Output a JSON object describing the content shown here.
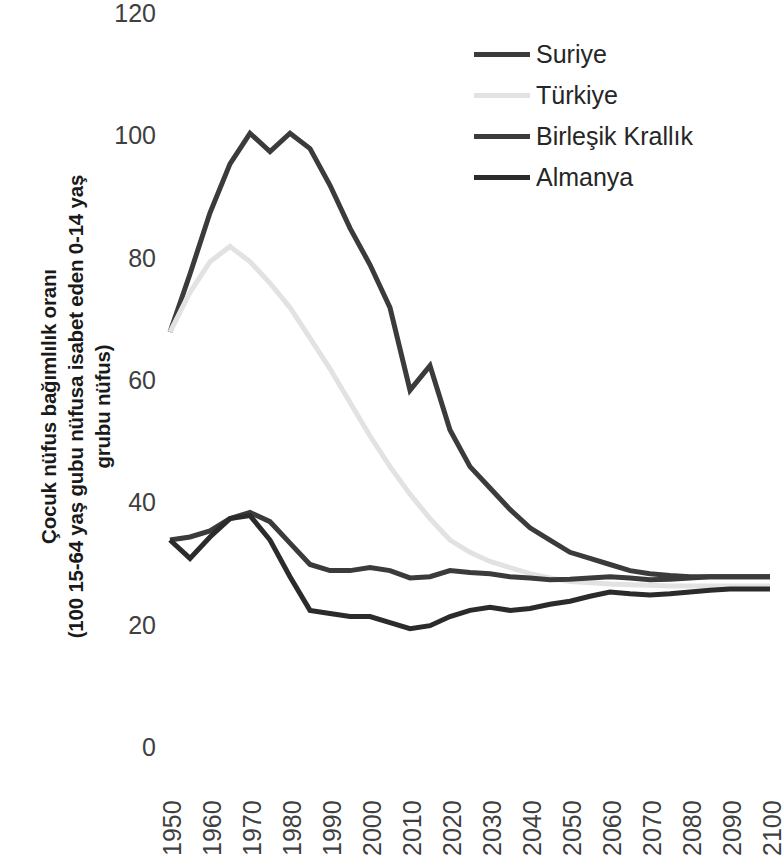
{
  "axis": {
    "y_title_lines": [
      "Çocuk nüfus bağımlılık oranı",
      "(100 15-64 yaş gubu nüfusa isabet eden 0-14 yaş",
      "grubu nüfus)"
    ],
    "y_ticks": [
      "0",
      "20",
      "40",
      "60",
      "80",
      "100",
      "120"
    ],
    "x_ticks": [
      "1950",
      "1960",
      "1970",
      "1980",
      "1990",
      "2000",
      "2010",
      "2020",
      "2030",
      "2040",
      "2050",
      "2060",
      "2070",
      "2080",
      "2090",
      "2100"
    ]
  },
  "legend": {
    "position": "top-right",
    "items": [
      {
        "label": "Suriye",
        "color": "#3b3b3b"
      },
      {
        "label": "Türkiye",
        "color": "#e2e2e2"
      },
      {
        "label": "Birleşik Krallık",
        "color": "#3b3b3b"
      },
      {
        "label": "Almanya",
        "color": "#2b2b2b"
      }
    ]
  },
  "chart_data": {
    "type": "line",
    "title": "",
    "xlabel": "",
    "ylabel": "Çocuk nüfus bağımlılık oranı (100 15-64 yaş gubu nüfusa isabet eden 0-14 yaş grubu nüfus)",
    "xlim": [
      1950,
      2100
    ],
    "ylim": [
      0,
      120
    ],
    "ytick_step": 20,
    "xtick_step": 10,
    "grid": false,
    "legend_position": "top-right",
    "x": [
      1950,
      1955,
      1960,
      1965,
      1970,
      1975,
      1980,
      1985,
      1990,
      1995,
      2000,
      2005,
      2010,
      2015,
      2020,
      2025,
      2030,
      2035,
      2040,
      2045,
      2050,
      2055,
      2060,
      2065,
      2070,
      2075,
      2080,
      2085,
      2090,
      2095,
      2100
    ],
    "series": [
      {
        "name": "Suriye",
        "color": "#3b3b3b",
        "values": [
          68.0,
          77.5,
          87.5,
          95.5,
          100.5,
          97.5,
          100.5,
          98.0,
          92.0,
          85.0,
          79.0,
          72.0,
          58.5,
          62.5,
          52.0,
          46.0,
          42.5,
          39.0,
          36.0,
          34.0,
          32.0,
          31.0,
          30.0,
          29.0,
          28.5,
          28.2,
          28.0,
          28.0,
          28.0,
          28.0,
          28.0
        ]
      },
      {
        "name": "Türkiye",
        "color": "#e2e2e2",
        "values": [
          68.0,
          74.5,
          79.5,
          82.0,
          79.5,
          76.0,
          72.0,
          67.0,
          62.0,
          56.5,
          51.0,
          46.0,
          41.5,
          37.5,
          34.0,
          32.0,
          30.5,
          29.5,
          28.5,
          27.8,
          27.2,
          27.0,
          26.8,
          26.7,
          26.6,
          26.5,
          26.5,
          26.5,
          26.5,
          26.5,
          26.5
        ]
      },
      {
        "name": "Birleşik Krallık",
        "color": "#3b3b3b",
        "values": [
          34.0,
          34.5,
          35.5,
          37.5,
          38.5,
          37.0,
          33.5,
          30.0,
          29.0,
          29.0,
          29.5,
          29.0,
          27.8,
          28.0,
          29.0,
          28.7,
          28.5,
          28.0,
          27.8,
          27.5,
          27.6,
          27.8,
          28.0,
          27.8,
          27.5,
          27.6,
          27.8,
          28.0,
          28.0,
          28.0,
          28.0
        ]
      },
      {
        "name": "Almanya",
        "color": "#2b2b2b",
        "values": [
          34.0,
          31.0,
          34.5,
          37.5,
          38.0,
          34.0,
          28.0,
          22.5,
          22.0,
          21.5,
          21.5,
          20.5,
          19.5,
          20.0,
          21.5,
          22.5,
          23.0,
          22.5,
          22.8,
          23.5,
          24.0,
          24.8,
          25.5,
          25.2,
          25.0,
          25.2,
          25.5,
          25.8,
          26.0,
          26.0,
          26.0
        ]
      }
    ]
  }
}
